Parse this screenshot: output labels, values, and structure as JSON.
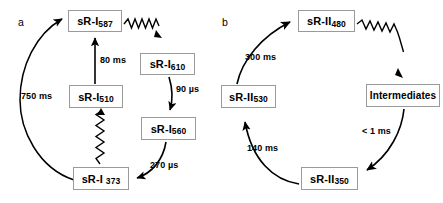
{
  "figure": {
    "panels": [
      {
        "letter": "a",
        "letter_pos": {
          "x": 18,
          "y": 24
        },
        "nodes": [
          {
            "id": "sri587",
            "base": "sR-I",
            "sub": "587",
            "gap": false,
            "x": 68,
            "y": 10,
            "w": 54,
            "h": 22
          },
          {
            "id": "sri610",
            "base": "sR-I",
            "sub": "610",
            "gap": false,
            "x": 140,
            "y": 53,
            "w": 55,
            "h": 22
          },
          {
            "id": "sri510",
            "base": "sR-I",
            "sub": "510",
            "gap": false,
            "x": 69,
            "y": 85,
            "w": 54,
            "h": 23
          },
          {
            "id": "sri560",
            "base": "sR-I",
            "sub": "560",
            "gap": false,
            "x": 141,
            "y": 117,
            "w": 55,
            "h": 23
          },
          {
            "id": "sri373",
            "base": "sR-I",
            "sub": "373",
            "gap": true,
            "x": 73,
            "y": 167,
            "w": 56,
            "h": 23
          }
        ],
        "time_labels": [
          {
            "id": "t750",
            "text": "750 ms",
            "x": 21,
            "y": 91
          },
          {
            "id": "t80",
            "text": "80 ms",
            "x": 73,
            "y": 55
          },
          {
            "id": "t90",
            "text": "90 µs",
            "x": 176,
            "y": 84
          },
          {
            "id": "t270",
            "text": "270 µs",
            "x": 150,
            "y": 160
          }
        ]
      },
      {
        "letter": "b",
        "letter_pos": {
          "x": 222,
          "y": 24
        },
        "nodes": [
          {
            "id": "srii480",
            "base": "sR-II",
            "sub": "480",
            "gap": false,
            "x": 298,
            "y": 10,
            "w": 57,
            "h": 22
          },
          {
            "id": "intermediates",
            "base": "Intermediates",
            "sub": "",
            "gap": false,
            "x": 366,
            "y": 84,
            "w": 74,
            "h": 23
          },
          {
            "id": "srii530",
            "base": "sR-II",
            "sub": "530",
            "gap": false,
            "x": 221,
            "y": 85,
            "w": 55,
            "h": 23
          },
          {
            "id": "srii350",
            "base": "sR-II",
            "sub": "350",
            "gap": false,
            "x": 301,
            "y": 167,
            "w": 57,
            "h": 23
          }
        ],
        "time_labels": [
          {
            "id": "t300",
            "text": "300 ms",
            "x": 245,
            "y": 52
          },
          {
            "id": "t1ms",
            "text": "< 1 ms",
            "x": 362,
            "y": 126
          },
          {
            "id": "t140",
            "text": "140 ms",
            "x": 247,
            "y": 143
          }
        ]
      }
    ],
    "colors": {
      "stroke": "#000000",
      "box_border": "#9a9a9a",
      "background": "#ffffff"
    }
  }
}
